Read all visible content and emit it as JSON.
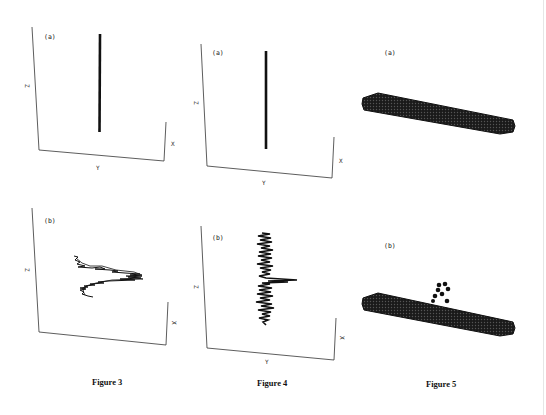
{
  "figures": [
    {
      "id": "figure-3",
      "caption": "Figure 3",
      "panels": [
        {
          "label": "(a)",
          "axes": {
            "z": "Z",
            "x": "X",
            "y": "Y"
          },
          "content": "straight vertical chain"
        },
        {
          "label": "(b)",
          "axes": {
            "z": "Z",
            "x": "X"
          },
          "content": "zig-zag collapsed chain"
        }
      ]
    },
    {
      "id": "figure-4",
      "caption": "Figure 4",
      "panels": [
        {
          "label": "(a)",
          "axes": {
            "z": "Z",
            "x": "X",
            "y": "Y"
          },
          "content": "straight vertical chain"
        },
        {
          "label": "(b)",
          "axes": {
            "z": "Z",
            "x": "X",
            "y": "Y"
          },
          "content": "noisy vertical chain with spike"
        }
      ]
    },
    {
      "id": "figure-5",
      "caption": "Figure 5",
      "panels": [
        {
          "label": "(a)",
          "content": "bundle of spheres forming a rod"
        },
        {
          "label": "(b)",
          "content": "rod with small cluster of spheres detached above"
        }
      ]
    }
  ]
}
